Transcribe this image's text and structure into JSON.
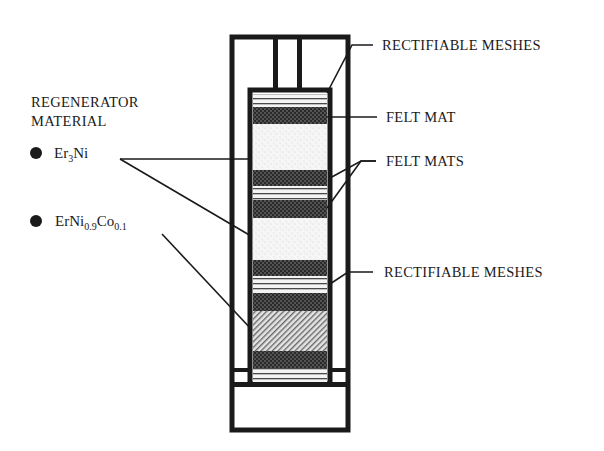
{
  "diagram": {
    "type": "regenerator cross-section",
    "legend": {
      "title_line1": "REGENERATOR",
      "title_line2": "MATERIAL",
      "materials": [
        {
          "symbol": "bullet",
          "name_base": "Er",
          "name_sub1": "3",
          "name_rest": "Ni"
        },
        {
          "symbol": "bullet",
          "name_base": "ErNi",
          "name_sub1": "0.9",
          "name_mid": "Co",
          "name_sub2": "0.1"
        }
      ]
    },
    "labels": {
      "top_meshes": "RECTIFIABLE MESHES",
      "felt_mat": "FELT MAT",
      "felt_mats": "FELT MATS",
      "bottom_meshes": "RECTIFIABLE MESHES"
    },
    "layers_top_to_bottom": [
      "rectifiable mesh",
      "felt mat",
      "Er3Ni",
      "felt mat",
      "rectifiable mesh",
      "felt mat",
      "Er3Ni",
      "felt mat",
      "rectifiable mesh",
      "felt mat",
      "ErNi0.9Co0.1",
      "felt mat",
      "rectifiable mesh"
    ],
    "colors": {
      "ink": "#1a1a1a",
      "background": "#ffffff"
    }
  }
}
